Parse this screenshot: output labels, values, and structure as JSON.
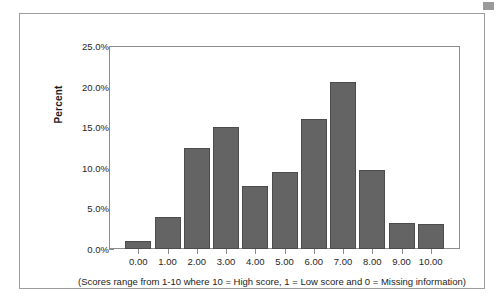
{
  "chart_data": {
    "type": "bar",
    "title": "",
    "subtitle": "",
    "xlabel": "",
    "ylabel": "Percent",
    "caption": "(Scores range from 1-10 where 10 = High score, 1 = Low score and 0 = Missing information)",
    "categories": [
      "0.00",
      "1.00",
      "2.00",
      "3.00",
      "4.00",
      "5.00",
      "6.00",
      "7.00",
      "8.00",
      "9.00",
      "10.00"
    ],
    "values": [
      1.0,
      3.9,
      12.4,
      15.0,
      7.8,
      9.5,
      16.0,
      20.6,
      9.7,
      3.2,
      3.1
    ],
    "value_labels": [
      "1.0%",
      "3.9%",
      "12.4%",
      "15.0%",
      "7.8%",
      "9.5%",
      "16.0%",
      "20.6%",
      "9.7%",
      "3.2%",
      "3.1%"
    ],
    "ylim": [
      0,
      25
    ],
    "ytick_values": [
      0,
      5,
      10,
      15,
      20,
      25
    ],
    "ytick_labels": [
      "0.0%",
      "5.0%",
      "10.0%",
      "15.0%",
      "20.0%",
      "25.0%"
    ],
    "grid": false,
    "legend": null,
    "bar_color": "#646464",
    "bar_edge_color": "#4c4c4c",
    "axis_color": "#8d8d8d",
    "frame_color": "#9d9d9d",
    "background": "#ffffff"
  }
}
